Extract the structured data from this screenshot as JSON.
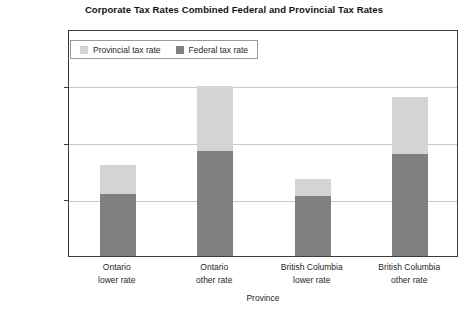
{
  "chart_data": {
    "type": "bar",
    "subtype": "stacked",
    "title": "Corporate Tax Rates Combined Federal and Provincial Tax Rates",
    "xlabel": "Province",
    "ylabel": "Tax rate",
    "ylim": [
      0,
      40
    ],
    "ytick_labels": [
      "0%",
      "10%",
      "20%",
      "30%",
      "40%"
    ],
    "ytick_values": [
      0,
      10,
      20,
      30,
      40
    ],
    "grid": true,
    "legend_position": "top-left-inside",
    "categories": [
      "Ontario lower rate",
      "Ontario other rate",
      "British Columbia lower rate",
      "British Columbia other rate"
    ],
    "category_lines": [
      [
        "Ontario",
        "lower rate"
      ],
      [
        "Ontario",
        "other rate"
      ],
      [
        "British Columbia",
        "lower rate"
      ],
      [
        "British Columbia",
        "other rate"
      ]
    ],
    "series": [
      {
        "name": "Federal tax rate",
        "color": "#808080",
        "values": [
          11.0,
          18.5,
          10.5,
          18.0
        ]
      },
      {
        "name": "Provincial tax rate",
        "color": "#d4d4d4",
        "values": [
          5.0,
          11.5,
          3.0,
          10.0
        ]
      }
    ],
    "totals": [
      16.0,
      30.0,
      13.5,
      28.0
    ]
  },
  "legend": {
    "items": [
      {
        "label": "Provincial tax rate",
        "swatch": "provincial-swatch"
      },
      {
        "label": "Federal tax rate",
        "swatch": "federal-swatch"
      }
    ]
  }
}
